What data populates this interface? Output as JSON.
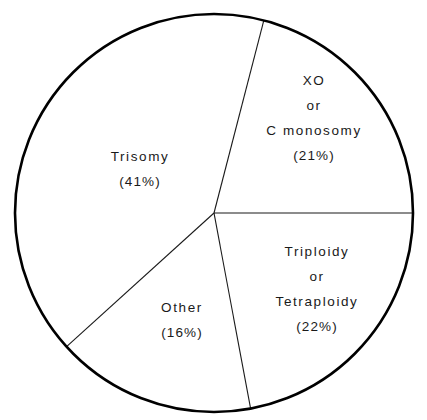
{
  "chart_data": {
    "type": "pie",
    "title": "",
    "subtitle": "",
    "xlabel": "",
    "ylabel": "",
    "legend_position": "none",
    "grid": false,
    "labels_inside_slices": true,
    "units": "percent",
    "total": 100,
    "categories": [
      "XO or C monosomy",
      "Triploidy or Tetraploidy",
      "Other",
      "Trisomy"
    ],
    "values": [
      21,
      22,
      16,
      41
    ],
    "slices": [
      {
        "id": "xo",
        "name": "XO or C monosomy",
        "value": 21,
        "percent_text": "(21%)",
        "label_lines": [
          "XO",
          "or",
          "C monosomy"
        ],
        "start_angle_deg": 284.5,
        "end_angle_deg": 360.0,
        "sweep_deg": 75.5,
        "fill": "#ffffff",
        "stroke": "#000000"
      },
      {
        "id": "triploidy",
        "name": "Triploidy or Tetraploidy",
        "value": 22,
        "percent_text": "(22%)",
        "label_lines": [
          "Triploidy",
          "or",
          "Tetraploidy"
        ],
        "start_angle_deg": 0.0,
        "end_angle_deg": 79.4,
        "sweep_deg": 79.4,
        "fill": "#ffffff",
        "stroke": "#000000"
      },
      {
        "id": "other",
        "name": "Other",
        "value": 16,
        "percent_text": "(16%)",
        "label_lines": [
          "Other"
        ],
        "start_angle_deg": 79.4,
        "end_angle_deg": 137.8,
        "sweep_deg": 58.4,
        "fill": "#ffffff",
        "stroke": "#000000"
      },
      {
        "id": "trisomy",
        "name": "Trisomy",
        "value": 41,
        "percent_text": "(41%)",
        "label_lines": [
          "Trisomy"
        ],
        "start_angle_deg": 137.8,
        "end_angle_deg": 284.5,
        "sweep_deg": 146.7,
        "fill": "#ffffff",
        "stroke": "#000000"
      }
    ],
    "geometry": {
      "center_x": 214,
      "center_y": 213,
      "radius": 199,
      "outline_width": 2.6,
      "divider_width": 1.1
    },
    "colors": {
      "background": "#ffffff",
      "outline": "#000000",
      "divider": "#1a1a1a",
      "text": "#1a1a1a"
    }
  },
  "labels": {
    "xo": {
      "line1": "XO",
      "line2": "or",
      "line3": "C monosomy",
      "percent": "(21%)"
    },
    "triploidy": {
      "line1": "Triploidy",
      "line2": "or",
      "line3": "Tetraploidy",
      "percent": "(22%)"
    },
    "trisomy": {
      "line1": "Trisomy",
      "percent": "(41%)"
    },
    "other": {
      "line1": "Other",
      "percent": "(16%)"
    }
  }
}
